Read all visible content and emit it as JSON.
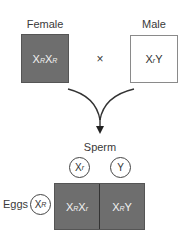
{
  "parents": {
    "female": {
      "label": "Female",
      "genotype": [
        {
          "base": "X",
          "sup": "R"
        },
        {
          "base": "X",
          "sup": "R"
        }
      ],
      "color": "#6e6e6e"
    },
    "cross_symbol": "×",
    "male": {
      "label": "Male",
      "genotype": [
        {
          "base": "X",
          "sup": "r"
        },
        {
          "base": "Y",
          "sup": ""
        }
      ],
      "color": "#ffffff"
    }
  },
  "sperm": {
    "label": "Sperm",
    "gametes": [
      {
        "base": "X",
        "sup": "r"
      },
      {
        "base": "Y",
        "sup": ""
      }
    ]
  },
  "eggs": {
    "label": "Eggs",
    "gametes": [
      {
        "base": "X",
        "sup": "R"
      }
    ]
  },
  "punnett": {
    "cells": [
      [
        {
          "base": "X",
          "sup": "R"
        },
        {
          "base": "X",
          "sup": "r"
        }
      ],
      [
        {
          "base": "X",
          "sup": "R"
        },
        {
          "base": "Y",
          "sup": ""
        }
      ]
    ],
    "color": "#6e6e6e"
  }
}
